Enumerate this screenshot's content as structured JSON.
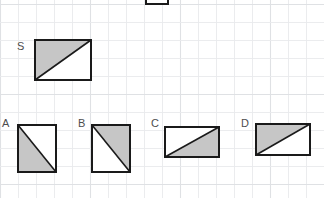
{
  "page": {
    "background_color": "#ffffff",
    "width": 324,
    "height": 198
  },
  "grid": {
    "name": "graph-paper-grid",
    "minor_spacing": 18,
    "minor_color": "#e9eaec",
    "major_color": "#dfe1e4",
    "visible": true
  },
  "style": {
    "stroke_color": "#1a1a1a",
    "shaded_fill": "#c6c6c6",
    "unshaded_fill": "#ffffff",
    "stroke_width": 2,
    "label_color": "#4d4d4d"
  },
  "partial_shape": {
    "name": "clipped-rectangle-top",
    "label": "",
    "x": 146,
    "y": -12,
    "width": 22,
    "height": 16,
    "note": "partially cut off by top edge of image"
  },
  "reference": {
    "label": "S",
    "label_x": 17,
    "label_y": 41,
    "x": 35,
    "y": 40,
    "width": 56,
    "height": 40,
    "diagonal": "bottom-left-to-top-right",
    "shaded_region": "upper-left"
  },
  "options": [
    {
      "label": "A",
      "label_x": 2,
      "label_y": 118,
      "x": 18,
      "y": 125,
      "width": 38,
      "height": 47,
      "diagonal": "top-left-to-bottom-right",
      "shaded_region": "lower-left"
    },
    {
      "label": "B",
      "label_x": 78,
      "label_y": 118,
      "x": 92,
      "y": 125,
      "width": 38,
      "height": 47,
      "diagonal": "top-left-to-bottom-right",
      "shaded_region": "upper-right"
    },
    {
      "label": "C",
      "label_x": 151,
      "label_y": 118,
      "x": 165,
      "y": 127,
      "width": 54,
      "height": 30,
      "diagonal": "bottom-left-to-top-right",
      "shaded_region": "lower-right"
    },
    {
      "label": "D",
      "label_x": 241,
      "label_y": 118,
      "x": 256,
      "y": 124,
      "width": 54,
      "height": 31,
      "diagonal": "bottom-left-to-top-right",
      "shaded_region": "upper-left"
    }
  ]
}
